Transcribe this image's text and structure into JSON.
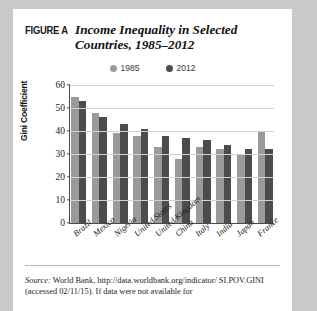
{
  "figure": {
    "label": "FIGURE A",
    "title": "Income Inequality in Selected Countries, 1985–2012"
  },
  "legend": {
    "position": "top-center",
    "items": [
      {
        "label": "1985",
        "color": "#9a9a9a"
      },
      {
        "label": "2012",
        "color": "#4c4c4c"
      }
    ]
  },
  "source": {
    "prefix": "Source:",
    "text": " World Bank, http://data.worldbank.org/indicator/ SI.POV.GINI (accessed 02/11/15). If data were not available for"
  },
  "chart_data": {
    "type": "bar",
    "title": "Income Inequality in Selected Countries, 1985–2012",
    "xlabel": "",
    "ylabel": "Gini Coefficient",
    "ylim": [
      0,
      60
    ],
    "yticks": [
      0,
      10,
      20,
      30,
      40,
      50,
      60
    ],
    "grid": true,
    "legend_position": "top-center",
    "categories": [
      "Brazil",
      "Mexico",
      "Nigeria",
      "United States",
      "United Kingdom",
      "China",
      "Italy",
      "India",
      "Japan",
      "France"
    ],
    "series": [
      {
        "name": "1985",
        "color": "#9a9a9a",
        "values": [
          55,
          48,
          39,
          38,
          33,
          28,
          33,
          32,
          30,
          40
        ]
      },
      {
        "name": "2012",
        "color": "#4c4c4c",
        "values": [
          53,
          46,
          43,
          41,
          38,
          37,
          36,
          34,
          32,
          32
        ]
      }
    ]
  }
}
